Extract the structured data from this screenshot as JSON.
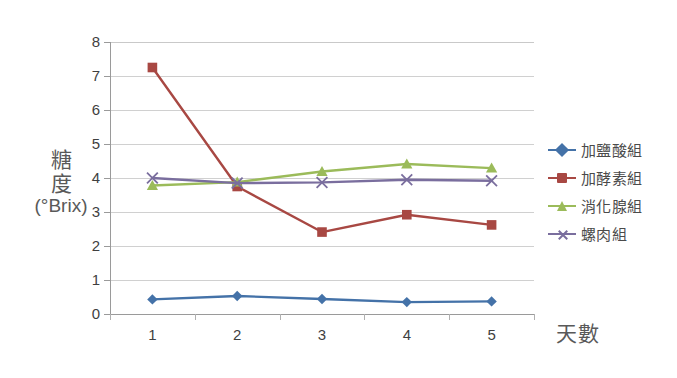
{
  "chart_data": {
    "type": "line",
    "title": "",
    "xlabel": "天數",
    "ylabel": "糖度 (°Brix)",
    "ylabel_lines": [
      "糖",
      "度",
      "(°Brix)"
    ],
    "categories": [
      "1",
      "2",
      "3",
      "4",
      "5"
    ],
    "x": [
      1,
      2,
      3,
      4,
      5
    ],
    "xlim": [
      0.5,
      5.5
    ],
    "ylim": [
      0,
      8
    ],
    "y_ticks": [
      0,
      1,
      2,
      3,
      4,
      5,
      6,
      7,
      8
    ],
    "y_tick_labels": [
      "0",
      "1",
      "2",
      "3",
      "4",
      "5",
      "6",
      "7",
      "8"
    ],
    "grid": true,
    "grid_axis": "y",
    "legend_position": "right",
    "series": [
      {
        "name": "加鹽酸組",
        "color": "#4472a8",
        "marker": "diamond",
        "values": [
          0.43,
          0.53,
          0.44,
          0.35,
          0.37
        ]
      },
      {
        "name": "加酵素組",
        "color": "#a84843",
        "marker": "square",
        "values": [
          7.25,
          3.75,
          2.41,
          2.92,
          2.62
        ]
      },
      {
        "name": "消化腺組",
        "color": "#9bbb5a",
        "marker": "triangle",
        "values": [
          3.78,
          3.88,
          4.19,
          4.41,
          4.29
        ]
      },
      {
        "name": "螺肉組",
        "color": "#7a6e9e",
        "marker": "cross",
        "values": [
          4.0,
          3.85,
          3.87,
          3.95,
          3.92
        ]
      }
    ]
  },
  "axes": {
    "y_title_line1": "糖",
    "y_title_line2": "度",
    "y_title_line3": "(°Brix)",
    "x_title": "天數"
  },
  "legend": {
    "items": [
      {
        "label": "加鹽酸組",
        "color": "#4472a8",
        "marker": "diamond"
      },
      {
        "label": "加酵素組",
        "color": "#a84843",
        "marker": "square"
      },
      {
        "label": "消化腺組",
        "color": "#9bbb5a",
        "marker": "triangle"
      },
      {
        "label": "螺肉組",
        "color": "#7a6e9e",
        "marker": "cross"
      }
    ]
  },
  "colors": {
    "gridline": "#d0d0d0",
    "axis": "#9a9a9a",
    "text": "#3f3f3f",
    "title_text": "#595959",
    "background": "#ffffff"
  }
}
